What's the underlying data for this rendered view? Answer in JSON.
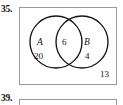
{
  "page": {
    "background_color": "#ffffff",
    "text_color": "#111111",
    "box_border_color": "#9a9a9a",
    "circle_stroke_color": "#141414"
  },
  "exercises": [
    {
      "number_label": "35.",
      "figure_type": "venn-diagram",
      "universe_box": {
        "outside_count": "13"
      },
      "sets": [
        {
          "name": "A",
          "only_count": "20"
        },
        {
          "name": "B",
          "only_count": "4"
        }
      ],
      "intersection_count": "6"
    },
    {
      "number_label": "39.",
      "figure_type": "venn-diagram",
      "clipped": true
    }
  ]
}
